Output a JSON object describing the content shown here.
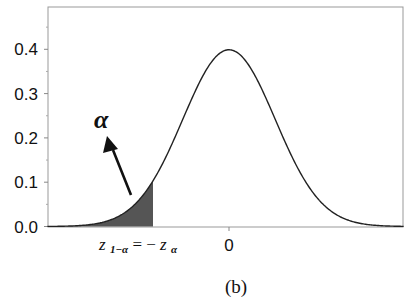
{
  "chart_data": {
    "type": "area",
    "title": "",
    "subtitle": "",
    "caption": "(b)",
    "xlabel": "",
    "ylabel": "",
    "distribution": "standard normal pdf",
    "ylim": [
      0.0,
      0.45
    ],
    "xlim": [
      -3.93,
      3.78
    ],
    "yticks": [
      0.0,
      0.1,
      0.2,
      0.3,
      0.4
    ],
    "ytick_labels": [
      "0.0",
      "0.1",
      "0.2",
      "0.3",
      "0.4"
    ],
    "xticks": [
      0
    ],
    "xtick_labels": [
      "0"
    ],
    "critical_value_label": "z₁₋α = −zα",
    "critical_value": -1.645,
    "shaded_region": {
      "from": -3.93,
      "to": -1.645,
      "label": "α",
      "color": "#555555"
    },
    "annotations": [
      {
        "text": "α",
        "arrow_from": [
          -2.1,
          0.09
        ],
        "arrow_to": [
          -2.55,
          0.22
        ]
      }
    ],
    "peak": {
      "x": 0,
      "y": 0.399
    },
    "grid": false,
    "legend": null
  },
  "labels": {
    "alpha": "α",
    "z_main": "z",
    "z_sub1": "1−α",
    "equals": " = −",
    "z_main2": "z",
    "z_sub2": "α",
    "zero": "0",
    "caption": "(b)"
  },
  "colors": {
    "shade": "#555555",
    "curve": "#222222",
    "axis": "#888888"
  }
}
